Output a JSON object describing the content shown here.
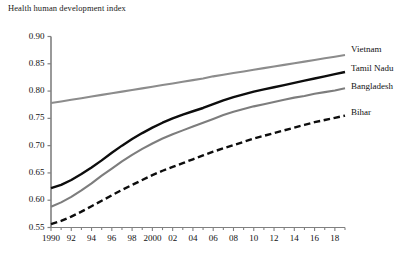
{
  "chart": {
    "title": "Health human development index",
    "ylabel": "",
    "xlabel": ""
  },
  "chart_data": {
    "type": "line",
    "title": "Health human development index",
    "xlabel": "",
    "ylabel": "",
    "ylim": [
      0.55,
      0.9
    ],
    "yticks": [
      "0.55",
      "0.60",
      "0.65",
      "0.70",
      "0.75",
      "0.80",
      "0.85",
      "0.90"
    ],
    "ytick_values": [
      0.55,
      0.6,
      0.65,
      0.7,
      0.75,
      0.8,
      0.85,
      0.9
    ],
    "xlim": [
      1990,
      2019
    ],
    "xticks": [
      "1990",
      "92",
      "94",
      "96",
      "98",
      "2000",
      "02",
      "04",
      "06",
      "08",
      "10",
      "12",
      "14",
      "16",
      "18"
    ],
    "xtick_values": [
      1990,
      1992,
      1994,
      1996,
      1998,
      2000,
      2002,
      2004,
      2006,
      2008,
      2010,
      2012,
      2014,
      2016,
      2018
    ],
    "minor_xticks": "annual",
    "grid": false,
    "legend_position": "right-inline-labels",
    "x": [
      1990,
      1991,
      1992,
      1993,
      1994,
      1995,
      1996,
      1997,
      1998,
      1999,
      2000,
      2001,
      2002,
      2003,
      2004,
      2005,
      2006,
      2007,
      2008,
      2009,
      2010,
      2011,
      2012,
      2013,
      2014,
      2015,
      2016,
      2017,
      2018,
      2019
    ],
    "series": [
      {
        "name": "Vietnam",
        "color": "#8c8c8c",
        "style": "solid",
        "width": 2.1,
        "values": [
          0.778,
          0.781,
          0.784,
          0.787,
          0.79,
          0.793,
          0.796,
          0.799,
          0.802,
          0.805,
          0.808,
          0.811,
          0.814,
          0.817,
          0.82,
          0.823,
          0.827,
          0.83,
          0.833,
          0.836,
          0.839,
          0.842,
          0.845,
          0.848,
          0.851,
          0.854,
          0.857,
          0.86,
          0.863,
          0.866
        ]
      },
      {
        "name": "Tamil Nadu",
        "color": "#0d0d0d",
        "style": "solid",
        "width": 2.4,
        "values": [
          0.622,
          0.628,
          0.637,
          0.648,
          0.66,
          0.673,
          0.687,
          0.7,
          0.712,
          0.723,
          0.733,
          0.742,
          0.75,
          0.757,
          0.763,
          0.769,
          0.776,
          0.783,
          0.789,
          0.794,
          0.799,
          0.803,
          0.807,
          0.811,
          0.815,
          0.819,
          0.823,
          0.827,
          0.831,
          0.835
        ]
      },
      {
        "name": "Bangladesh",
        "color": "#7d7d7d",
        "style": "solid",
        "width": 2.1,
        "values": [
          0.588,
          0.596,
          0.606,
          0.618,
          0.631,
          0.645,
          0.658,
          0.671,
          0.683,
          0.694,
          0.704,
          0.713,
          0.721,
          0.728,
          0.735,
          0.742,
          0.749,
          0.756,
          0.762,
          0.767,
          0.772,
          0.776,
          0.78,
          0.784,
          0.788,
          0.791,
          0.795,
          0.798,
          0.801,
          0.805
        ]
      },
      {
        "name": "Bihar",
        "color": "#0d0d0d",
        "style": "dashed",
        "width": 2.4,
        "values": [
          0.556,
          0.562,
          0.57,
          0.579,
          0.589,
          0.599,
          0.609,
          0.619,
          0.628,
          0.637,
          0.646,
          0.654,
          0.661,
          0.668,
          0.675,
          0.682,
          0.689,
          0.695,
          0.701,
          0.707,
          0.713,
          0.718,
          0.723,
          0.728,
          0.733,
          0.738,
          0.743,
          0.747,
          0.751,
          0.755
        ]
      }
    ]
  },
  "axis_geometry": {
    "left": 51,
    "right": 345,
    "top": 36.5,
    "bottom": 227.5
  },
  "series_labels": [
    {
      "text": "Vietnam",
      "x": 351,
      "y": 44
    },
    {
      "text": "Tamil Nadu",
      "x": 351,
      "y": 63
    },
    {
      "text": "Bangladesh",
      "x": 351,
      "y": 81
    },
    {
      "text": "Bihar",
      "x": 351,
      "y": 107
    }
  ]
}
